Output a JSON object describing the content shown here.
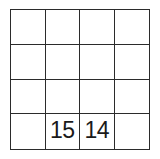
{
  "grid": {
    "rows": 4,
    "columns": 4,
    "border_color": "#2b2b2b",
    "background_color": "#ffffff",
    "text_color": "#1a1a1a",
    "cells": [
      [
        {
          "value": ""
        },
        {
          "value": ""
        },
        {
          "value": ""
        },
        {
          "value": ""
        }
      ],
      [
        {
          "value": ""
        },
        {
          "value": ""
        },
        {
          "value": ""
        },
        {
          "value": ""
        }
      ],
      [
        {
          "value": ""
        },
        {
          "value": ""
        },
        {
          "value": ""
        },
        {
          "value": ""
        }
      ],
      [
        {
          "value": ""
        },
        {
          "value": "15"
        },
        {
          "value": "14"
        },
        {
          "value": ""
        }
      ]
    ]
  }
}
